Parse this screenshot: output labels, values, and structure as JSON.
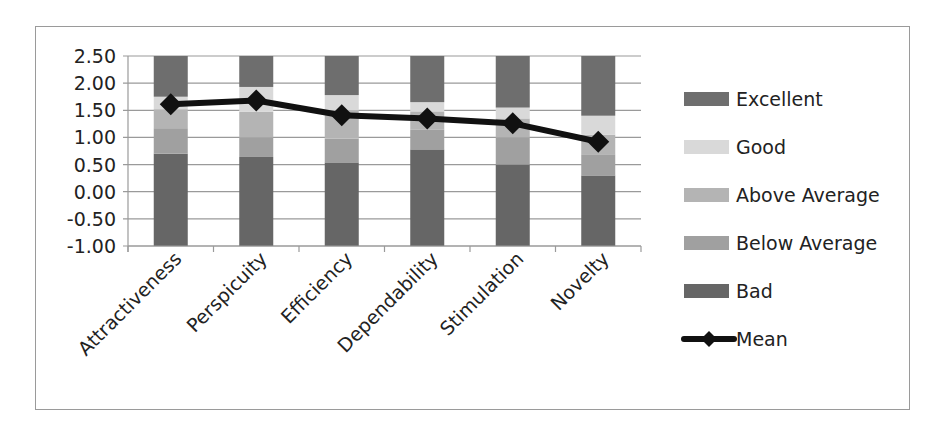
{
  "chart_data": {
    "type": "bar",
    "subtype": "stacked_bar_with_line",
    "title": "",
    "xlabel": "",
    "ylabel": "",
    "ylim": [
      -1.0,
      2.5
    ],
    "y_ticks": [
      "2.50",
      "2.00",
      "1.50",
      "1.00",
      "0.50",
      "0.00",
      "-0.50",
      "-1.00"
    ],
    "grid": true,
    "legend_position": "right",
    "categories": [
      "Attractiveness",
      "Perspicuity",
      "Efficiency",
      "Dependability",
      "Stimulation",
      "Novelty"
    ],
    "benchmark_upper_bounds": {
      "Bad": [
        0.7,
        0.64,
        0.54,
        0.78,
        0.5,
        0.3
      ],
      "Below Average": [
        1.17,
        1.0,
        0.98,
        1.14,
        1.0,
        0.69
      ],
      "Above Average": [
        1.52,
        1.47,
        1.5,
        1.48,
        1.35,
        1.05
      ],
      "Good": [
        1.75,
        1.93,
        1.78,
        1.65,
        1.55,
        1.4
      ],
      "Excellent": [
        2.5,
        2.5,
        2.5,
        2.5,
        2.5,
        2.5
      ]
    },
    "series": [
      {
        "name": "Excellent",
        "kind": "bar",
        "color": "#6e6e6e"
      },
      {
        "name": "Good",
        "kind": "bar",
        "color": "#d9d9d9"
      },
      {
        "name": "Above Average",
        "kind": "bar",
        "color": "#b4b4b4"
      },
      {
        "name": "Below Average",
        "kind": "bar",
        "color": "#a0a0a0"
      },
      {
        "name": "Bad",
        "kind": "bar",
        "color": "#666666"
      },
      {
        "name": "Mean",
        "kind": "line",
        "color": "#111111",
        "values": [
          1.61,
          1.68,
          1.41,
          1.35,
          1.26,
          0.92
        ]
      }
    ]
  },
  "legend": {
    "items": [
      {
        "label": "Excellent",
        "color": "#6e6e6e",
        "kind": "bar"
      },
      {
        "label": "Good",
        "color": "#d9d9d9",
        "kind": "bar"
      },
      {
        "label": "Above Average",
        "color": "#b4b4b4",
        "kind": "bar"
      },
      {
        "label": "Below Average",
        "color": "#a0a0a0",
        "kind": "bar"
      },
      {
        "label": "Bad",
        "color": "#666666",
        "kind": "bar"
      },
      {
        "label": "Mean",
        "color": "#111111",
        "kind": "line"
      }
    ]
  }
}
